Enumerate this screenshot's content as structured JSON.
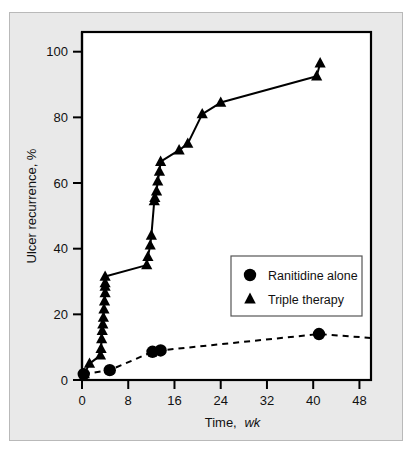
{
  "figure": {
    "background_color": "#e9e9e9",
    "plot_background_color": "#ffffff",
    "border_color": "#b9b9b9"
  },
  "legend": {
    "position": "center-right",
    "entries": [
      {
        "marker": "circle-marker",
        "label": "Ranitidine alone"
      },
      {
        "marker": "triangle-marker",
        "label": "Triple therapy"
      }
    ]
  },
  "axes": {
    "x": {
      "title_text": "Time,",
      "title_italic": "wk",
      "ticks": [
        "0",
        "8",
        "16",
        "24",
        "32",
        "40",
        "48"
      ],
      "tick_values": [
        0,
        8,
        16,
        24,
        32,
        40,
        48
      ],
      "range": [
        0,
        50
      ]
    },
    "y": {
      "title": "Ulcer recurrence, %",
      "ticks": [
        "0",
        "20",
        "40",
        "60",
        "80",
        "100"
      ],
      "tick_values": [
        0,
        20,
        40,
        60,
        80,
        100
      ],
      "range": [
        0,
        106
      ]
    }
  },
  "chart_data": {
    "type": "scatter",
    "title": "",
    "xlabel": "Time, wk",
    "ylabel": "Ulcer recurrence, %",
    "xlim": [
      0,
      50
    ],
    "ylim": [
      0,
      106
    ],
    "grid": false,
    "legend_position": "center-right",
    "series": [
      {
        "name": "Ranitidine alone",
        "marker": "circle",
        "marker_color": "#000000",
        "line_style": "dashed",
        "line_color": "#000000",
        "x": [
          0.3,
          4.8,
          12.2,
          13.6,
          41.0
        ],
        "y": [
          1.8,
          3.0,
          8.6,
          9.0,
          14.0
        ],
        "line_extends_to_x": 50
      },
      {
        "name": "Triple therapy",
        "marker": "triangle",
        "marker_color": "#000000",
        "line_style": "solid",
        "line_color": "#000000",
        "x": [
          0.4,
          1.3,
          3.2,
          3.3,
          3.4,
          3.5,
          3.6,
          3.7,
          3.8,
          3.9,
          4.0,
          4.0,
          4.0,
          4.0,
          11.2,
          11.4,
          11.8,
          12.0,
          12.5,
          12.6,
          12.9,
          13.1,
          13.4,
          13.6,
          16.8,
          18.3,
          20.8,
          24.0,
          40.6,
          41.2
        ],
        "y": [
          1.8,
          5.0,
          7.5,
          9.5,
          12.5,
          15.0,
          17.0,
          19.0,
          21.5,
          24.0,
          26.5,
          28.5,
          29.5,
          31.5,
          35.0,
          37.5,
          41.0,
          44.0,
          54.5,
          55.5,
          57.5,
          60.5,
          63.5,
          66.5,
          70.0,
          72.0,
          81.0,
          84.5,
          92.5,
          96.5
        ]
      }
    ]
  }
}
